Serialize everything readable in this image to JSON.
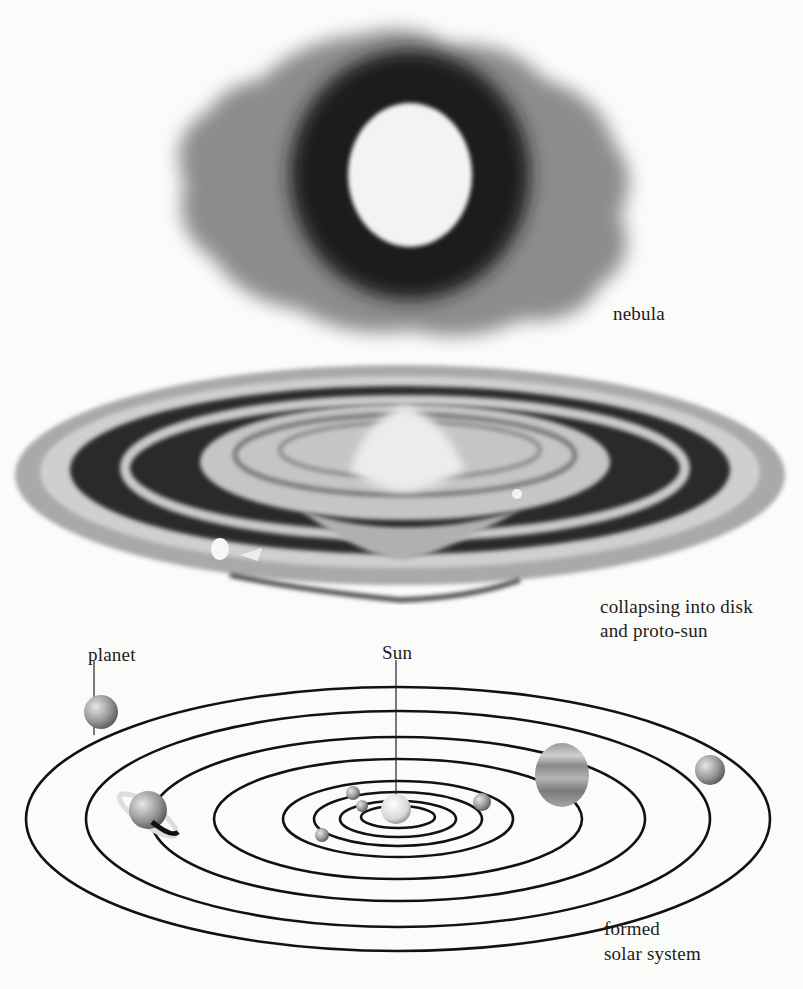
{
  "figure": {
    "stages": [
      {
        "id": "nebula",
        "label": "nebula"
      },
      {
        "id": "disk",
        "label_line1": "collapsing into disk",
        "label_line2": "and proto-sun"
      },
      {
        "id": "solar_system",
        "label_line1": "formed",
        "label_line2": "solar system"
      }
    ],
    "callouts": {
      "planet": "planet",
      "sun": "Sun"
    },
    "orbit_count": 8,
    "planet_count": 8,
    "colors": {
      "background": "#fbfbf9",
      "nebula_outer": "#8a8a8a",
      "nebula_inner": "#1e1e1e",
      "nebula_core": "#f2f2f2",
      "disk_dark": "#2a2a2a",
      "disk_light": "#bdbdbd",
      "orbit_line": "#111111",
      "planet_fill": "#a8a8a8"
    }
  }
}
